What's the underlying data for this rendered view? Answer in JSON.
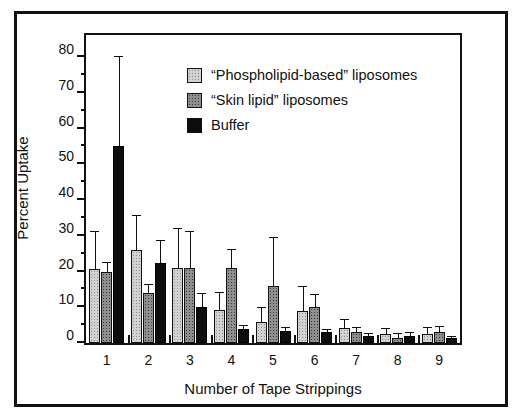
{
  "chart_data": {
    "type": "bar",
    "title": "",
    "xlabel": "Number of Tape Strippings",
    "ylabel": "Percent Uptake",
    "categories": [
      "1",
      "2",
      "3",
      "4",
      "5",
      "6",
      "7",
      "8",
      "9"
    ],
    "ylim": [
      0,
      80
    ],
    "ytick_major": [
      0,
      10,
      20,
      30,
      40,
      50,
      60,
      70,
      80
    ],
    "ytick_minor": [
      5,
      15,
      25,
      35,
      45,
      55,
      65,
      75
    ],
    "grid": false,
    "legend_position": "upper-center",
    "series": [
      {
        "name": "“Phospholipid-based” liposomes",
        "color": "#d2d2d2",
        "values": [
          20.7,
          26.0,
          21.0,
          9.3,
          6.0,
          8.9,
          4.2,
          2.5,
          2.5
        ],
        "errors": [
          10.3,
          9.5,
          11.0,
          4.7,
          3.8,
          6.7,
          2.2,
          1.3,
          1.6
        ]
      },
      {
        "name": "“Skin lipid” liposomes",
        "color": "#8f8f8f",
        "values": [
          20.0,
          14.0,
          21.0,
          21.0,
          16.0,
          10.0,
          3.0,
          1.3,
          3.0
        ],
        "errors": [
          2.5,
          2.3,
          10.0,
          5.0,
          13.3,
          3.5,
          1.2,
          1.2,
          1.6
        ]
      },
      {
        "name": "Buffer",
        "color": "#0d0d0d",
        "values": [
          55.0,
          22.5,
          10.0,
          4.0,
          3.5,
          3.2,
          2.0,
          2.0,
          1.3
        ],
        "errors": [
          25.0,
          6.0,
          3.6,
          0.7,
          0.6,
          0.5,
          0.5,
          0.8,
          0.5
        ]
      }
    ]
  }
}
